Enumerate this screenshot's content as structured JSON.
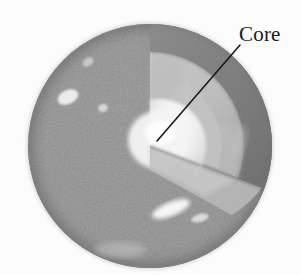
{
  "figure": {
    "type": "cutaway-sphere-diagram",
    "background_color": "#fcfcfc",
    "rendering": "grayscale-halftone-photo-illustration",
    "width": 302,
    "height": 275
  },
  "sphere": {
    "center_x": 150,
    "center_y": 146,
    "radius": 122,
    "surface_description": "mottled speckled gray crust with specular highlights",
    "surface_color": "#9a9a9a",
    "surface_shadow_color": "#6f6f6f",
    "edge_color": "#5e5e5e",
    "highlights": [
      {
        "cx": 68,
        "cy": 97,
        "rx": 11,
        "ry": 7,
        "angle": -25,
        "color": "#f2f2f2"
      },
      {
        "cx": 103,
        "cy": 108,
        "rx": 5,
        "ry": 4,
        "angle": -20,
        "color": "#e6e6e6"
      },
      {
        "cx": 171,
        "cy": 209,
        "rx": 20,
        "ry": 7,
        "angle": -22,
        "color": "#fbfbfb"
      },
      {
        "cx": 200,
        "cy": 218,
        "rx": 9,
        "ry": 4,
        "angle": -15,
        "color": "#ececec"
      },
      {
        "cx": 88,
        "cy": 62,
        "rx": 6,
        "ry": 4,
        "angle": -35,
        "color": "#dedede"
      }
    ]
  },
  "layers": [
    {
      "name": "crust",
      "label": "",
      "order": 1,
      "color": "#9a9a9a",
      "cut_face_color": "#8b8b8b",
      "description": "outer speckled rocky surface"
    },
    {
      "name": "mantle",
      "label": "",
      "order": 2,
      "color": "#b9b9b9",
      "cut_face_color": "#c6c6c6",
      "description": "intermediate lighter gray shell revealed by the wedge cut"
    },
    {
      "name": "core",
      "label": "Core",
      "order": 3,
      "color": "#f0f0f0",
      "cut_face_color": "#e2e2e2",
      "description": "bright near-white innermost sphere"
    }
  ],
  "cutaway": {
    "description": "a quarter wedge removed from the upper-front-right of the sphere revealing concentric interior shells",
    "wedge_start_angle_deg": -90,
    "wedge_end_angle_deg": 20,
    "dark_cut_face_color": "#7d7d7d"
  },
  "annotation": {
    "label": "Core",
    "label_color": "#1a1a1a",
    "leader_line": {
      "x1": 240,
      "y1": 45,
      "x2": 157,
      "y2": 141,
      "color": "#1a1a1a",
      "width": 1.6
    }
  }
}
